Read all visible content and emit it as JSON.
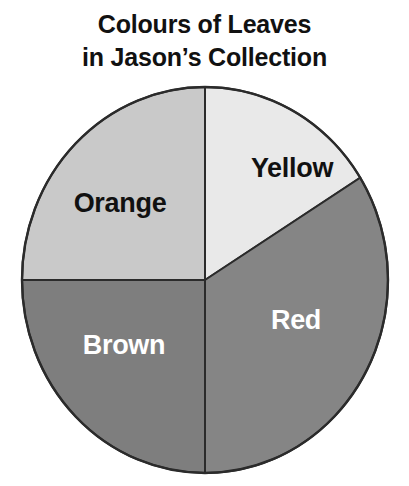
{
  "title": {
    "line1": "Colours of Leaves",
    "line2": "in Jason’s Collection"
  },
  "chart_data": {
    "type": "pie",
    "xlabel": "",
    "ylabel": "",
    "legend_position": "none",
    "grid": false,
    "labels_on_slices": true,
    "categories": [
      "Yellow",
      "Red",
      "Brown",
      "Orange"
    ],
    "values": [
      16,
      34,
      25,
      25
    ],
    "value_unit": "percent",
    "slices": [
      {
        "label": "Yellow",
        "value": 16,
        "start_angle_deg": 0,
        "end_angle_deg": 58,
        "fill": "#e9e9e9",
        "label_color": "#111111",
        "label_x": 292,
        "label_y": 170
      },
      {
        "label": "Red",
        "value": 34,
        "start_angle_deg": 58,
        "end_angle_deg": 180,
        "fill": "#858585",
        "label_color": "#ffffff",
        "label_x": 296,
        "label_y": 322
      },
      {
        "label": "Brown",
        "value": 25,
        "start_angle_deg": 180,
        "end_angle_deg": 270,
        "fill": "#7e7e7e",
        "label_color": "#ffffff",
        "label_x": 124,
        "label_y": 347
      },
      {
        "label": "Orange",
        "value": 25,
        "start_angle_deg": 270,
        "end_angle_deg": 360,
        "fill": "#c9c9c9",
        "label_color": "#111111",
        "label_x": 120,
        "label_y": 205
      }
    ],
    "geometry": {
      "center_x": 205,
      "center_y": 280,
      "radius_x": 183,
      "radius_y": 193,
      "outline_color": "#2b2b2b"
    }
  }
}
